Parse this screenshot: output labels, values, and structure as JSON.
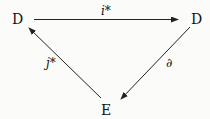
{
  "diagram": {
    "type": "commutative-triangle",
    "nodes": [
      {
        "id": "top-left",
        "label": "D"
      },
      {
        "id": "top-right",
        "label": "D"
      },
      {
        "id": "bottom",
        "label": "E"
      }
    ],
    "edges": [
      {
        "from": "top-left",
        "to": "top-right",
        "label": "i*"
      },
      {
        "from": "top-right",
        "to": "bottom",
        "label": "∂"
      },
      {
        "from": "bottom",
        "to": "top-left",
        "label": "j*"
      }
    ]
  }
}
